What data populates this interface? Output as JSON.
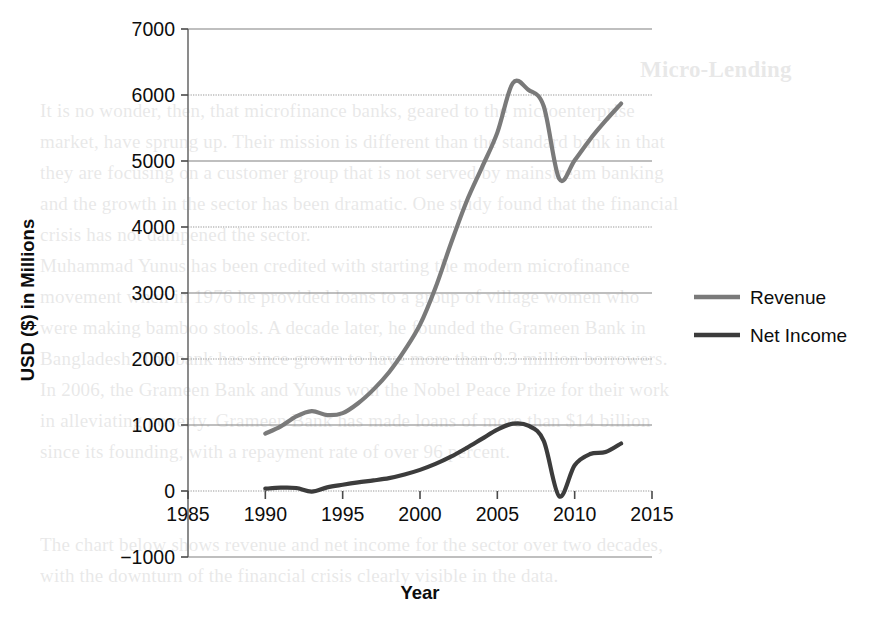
{
  "chart_data": {
    "type": "line",
    "title": "",
    "xlabel": "Year",
    "ylabel": "USD ($) in Millions",
    "xlim": [
      1985,
      2015
    ],
    "ylim": [
      -1000,
      7000
    ],
    "xticks": [
      "1985",
      "1990",
      "1995",
      "2000",
      "2005",
      "2010",
      "2015"
    ],
    "yticks": [
      "7000",
      "6000",
      "5000",
      "4000",
      "3000",
      "2000",
      "1000",
      "0",
      "−1000"
    ],
    "grid": "horizontal",
    "legend_position": "right-middle",
    "x": [
      1990,
      1991,
      1992,
      1993,
      1994,
      1995,
      1996,
      1997,
      1998,
      1999,
      2000,
      2001,
      2002,
      2003,
      2004,
      2005,
      2006,
      2007,
      2008,
      2009,
      2010,
      2011,
      2012,
      2013
    ],
    "series": [
      {
        "name": "Revenue",
        "color": "#7a7a7a",
        "values": [
          870,
          980,
          1130,
          1210,
          1150,
          1180,
          1330,
          1540,
          1800,
          2130,
          2520,
          3080,
          3750,
          4380,
          4900,
          5430,
          6180,
          6080,
          5830,
          4730,
          5010,
          5330,
          5610,
          5870
        ]
      },
      {
        "name": "Net Income",
        "color": "#3c3c3c",
        "values": [
          35,
          50,
          45,
          -10,
          55,
          95,
          130,
          160,
          195,
          250,
          320,
          410,
          520,
          650,
          790,
          930,
          1020,
          990,
          760,
          -80,
          390,
          560,
          590,
          720
        ]
      }
    ]
  },
  "axes": {
    "y_axis_title": "USD ($) in Millions",
    "x_axis_title": "Year",
    "y_tick_labels": [
      "7000",
      "6000",
      "5000",
      "4000",
      "3000",
      "2000",
      "1000",
      "0",
      "−1000"
    ],
    "x_tick_labels": [
      "1985",
      "1990",
      "1995",
      "2000",
      "2005",
      "2010",
      "2015"
    ]
  },
  "legend": {
    "items": [
      {
        "label": "Revenue",
        "color": "#7a7a7a"
      },
      {
        "label": "Net Income",
        "color": "#3c3c3c"
      }
    ]
  },
  "bleed_text": {
    "heading": "Micro-Lending",
    "lines": [
      "It is no wonder, then, that microfinance banks, geared to the microenterprise",
      "market, have sprung up. Their mission is different than the standard bank in that",
      "they are focusing on a customer group that is not served by mainstream banking",
      "and the growth in the sector has been dramatic. One study found that the financial",
      "crisis has not dampened the sector.",
      "Muhammad Yunus has been credited with starting the modern microfinance",
      "movement when in 1976 he provided loans to a group of village women who",
      "were making bamboo stools. A decade later, he founded the Grameen Bank in",
      "Bangladesh. The bank has since grown to have more than 8.3 million borrowers.",
      "In 2006, the Grameen Bank and Yunus won the Nobel Peace Prize for their work",
      "in alleviating poverty. Grameen Bank has made loans of more than $14 billion",
      "since its founding, with a repayment rate of over 96 percent.",
      "The chart below shows revenue and net income for the sector over two decades,",
      "with the downturn of the financial crisis clearly visible in the data."
    ]
  }
}
